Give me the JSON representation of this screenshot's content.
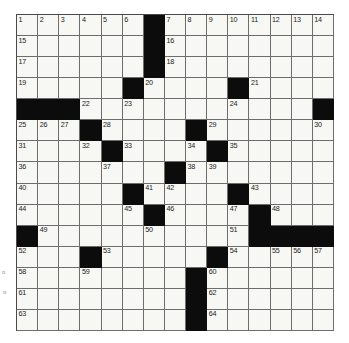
{
  "puzzle": {
    "kind": "crossword-grid",
    "rows": 15,
    "columns": 15,
    "cell_color": "#f7f7f4",
    "block_color": "#0c0c0c",
    "grid_line_color": "#6d6d6d",
    "number_color": "#1b1b1b",
    "blocks": [
      [
        0,
        6
      ],
      [
        1,
        6
      ],
      [
        2,
        6
      ],
      [
        3,
        5
      ],
      [
        3,
        10
      ],
      [
        4,
        0
      ],
      [
        4,
        1
      ],
      [
        4,
        2
      ],
      [
        4,
        14
      ],
      [
        5,
        3
      ],
      [
        5,
        8
      ],
      [
        6,
        4
      ],
      [
        6,
        9
      ],
      [
        7,
        7
      ],
      [
        8,
        5
      ],
      [
        8,
        10
      ],
      [
        9,
        6
      ],
      [
        9,
        11
      ],
      [
        10,
        0
      ],
      [
        10,
        11
      ],
      [
        10,
        12
      ],
      [
        10,
        13
      ],
      [
        10,
        14
      ],
      [
        11,
        3
      ],
      [
        11,
        9
      ],
      [
        12,
        8
      ],
      [
        13,
        8
      ],
      [
        14,
        8
      ]
    ],
    "numbers": [
      {
        "row": 0,
        "col": 0,
        "n": "1"
      },
      {
        "row": 0,
        "col": 1,
        "n": "2"
      },
      {
        "row": 0,
        "col": 2,
        "n": "3"
      },
      {
        "row": 0,
        "col": 3,
        "n": "4"
      },
      {
        "row": 0,
        "col": 4,
        "n": "5"
      },
      {
        "row": 0,
        "col": 5,
        "n": "6"
      },
      {
        "row": 0,
        "col": 7,
        "n": "7"
      },
      {
        "row": 0,
        "col": 8,
        "n": "8"
      },
      {
        "row": 0,
        "col": 9,
        "n": "9"
      },
      {
        "row": 0,
        "col": 10,
        "n": "10"
      },
      {
        "row": 0,
        "col": 11,
        "n": "11"
      },
      {
        "row": 0,
        "col": 12,
        "n": "12"
      },
      {
        "row": 0,
        "col": 13,
        "n": "13"
      },
      {
        "row": 0,
        "col": 14,
        "n": "14"
      },
      {
        "row": 1,
        "col": 0,
        "n": "15"
      },
      {
        "row": 1,
        "col": 7,
        "n": "16"
      },
      {
        "row": 2,
        "col": 0,
        "n": "17"
      },
      {
        "row": 2,
        "col": 7,
        "n": "18"
      },
      {
        "row": 3,
        "col": 0,
        "n": "19"
      },
      {
        "row": 3,
        "col": 6,
        "n": "20"
      },
      {
        "row": 3,
        "col": 11,
        "n": "21"
      },
      {
        "row": 4,
        "col": 3,
        "n": "22"
      },
      {
        "row": 4,
        "col": 5,
        "n": "23"
      },
      {
        "row": 4,
        "col": 10,
        "n": "24"
      },
      {
        "row": 5,
        "col": 0,
        "n": "25"
      },
      {
        "row": 5,
        "col": 1,
        "n": "26"
      },
      {
        "row": 5,
        "col": 2,
        "n": "27"
      },
      {
        "row": 5,
        "col": 4,
        "n": "28"
      },
      {
        "row": 5,
        "col": 9,
        "n": "29"
      },
      {
        "row": 5,
        "col": 14,
        "n": "30"
      },
      {
        "row": 6,
        "col": 0,
        "n": "31"
      },
      {
        "row": 6,
        "col": 3,
        "n": "32"
      },
      {
        "row": 6,
        "col": 5,
        "n": "33"
      },
      {
        "row": 6,
        "col": 8,
        "n": "34"
      },
      {
        "row": 6,
        "col": 10,
        "n": "35"
      },
      {
        "row": 7,
        "col": 0,
        "n": "36"
      },
      {
        "row": 7,
        "col": 4,
        "n": "37"
      },
      {
        "row": 7,
        "col": 8,
        "n": "38"
      },
      {
        "row": 7,
        "col": 9,
        "n": "39"
      },
      {
        "row": 8,
        "col": 0,
        "n": "40"
      },
      {
        "row": 8,
        "col": 6,
        "n": "41"
      },
      {
        "row": 8,
        "col": 7,
        "n": "42"
      },
      {
        "row": 8,
        "col": 11,
        "n": "43"
      },
      {
        "row": 9,
        "col": 0,
        "n": "44"
      },
      {
        "row": 9,
        "col": 5,
        "n": "45"
      },
      {
        "row": 9,
        "col": 7,
        "n": "46"
      },
      {
        "row": 9,
        "col": 10,
        "n": "47"
      },
      {
        "row": 9,
        "col": 12,
        "n": "48"
      },
      {
        "row": 10,
        "col": 1,
        "n": "49"
      },
      {
        "row": 10,
        "col": 6,
        "n": "50"
      },
      {
        "row": 10,
        "col": 10,
        "n": "51"
      },
      {
        "row": 11,
        "col": 0,
        "n": "52"
      },
      {
        "row": 11,
        "col": 4,
        "n": "53"
      },
      {
        "row": 11,
        "col": 10,
        "n": "54"
      },
      {
        "row": 11,
        "col": 12,
        "n": "55"
      },
      {
        "row": 11,
        "col": 13,
        "n": "56"
      },
      {
        "row": 11,
        "col": 14,
        "n": "57"
      },
      {
        "row": 12,
        "col": 0,
        "n": "58"
      },
      {
        "row": 12,
        "col": 3,
        "n": "59"
      },
      {
        "row": 12,
        "col": 9,
        "n": "60"
      },
      {
        "row": 13,
        "col": 0,
        "n": "61"
      },
      {
        "row": 13,
        "col": 9,
        "n": "62"
      },
      {
        "row": 14,
        "col": 0,
        "n": "63"
      },
      {
        "row": 14,
        "col": 9,
        "n": "64"
      }
    ],
    "margin_marks": [
      {
        "id": "mark-a",
        "text": "n"
      },
      {
        "id": "mark-b",
        "text": "n"
      }
    ]
  }
}
